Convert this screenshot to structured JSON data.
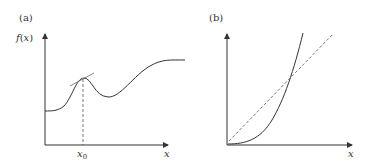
{
  "panels": [
    {
      "id": "a",
      "label": "(a)",
      "y_axis_label": "f(x)",
      "y_axis_label_f": "f",
      "y_axis_label_paren_open": "(",
      "y_axis_label_x": "x",
      "y_axis_label_paren_close": ")",
      "x_axis_label": "x",
      "x_tick_label": "x",
      "x_tick_subscript": "0",
      "description": "Smooth curve f(x) with a local maximum at x0; a tangent line touches the curve at the peak and a dashed vertical line drops from the peak to x0 on the x-axis."
    },
    {
      "id": "b",
      "label": "(b)",
      "x_axis_label": "x",
      "description": "Convex parabola starting at the origin (solid) and a straight dashed line through the origin, intersecting the curve."
    }
  ],
  "colors": {
    "axis": "#333333",
    "curve": "#333333",
    "dashed": "#555555",
    "tangent": "#666666"
  }
}
